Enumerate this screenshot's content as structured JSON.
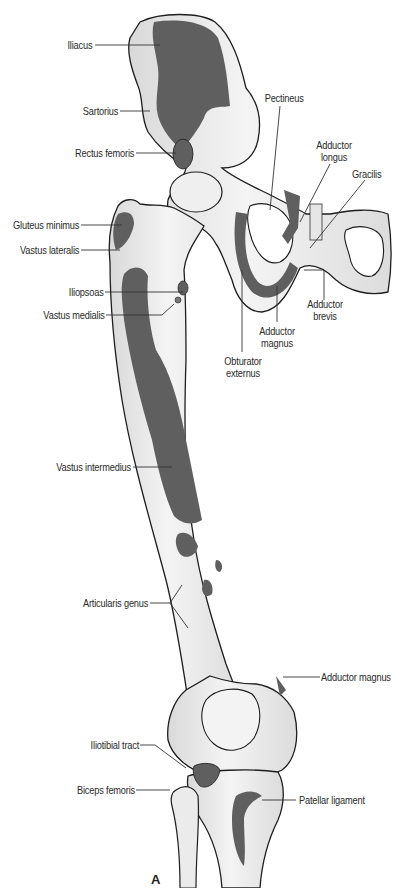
{
  "figure": {
    "panel_letter": "A",
    "colors": {
      "bone": "#ededed",
      "bone_shadow": "#d6d6d6",
      "muscle_attachment": "#5f5f5f",
      "outline": "#1e1e1e",
      "leader_line": "#333333",
      "text": "#2a2a2a"
    },
    "labels": {
      "iliacus": "Iliacus",
      "sartorius": "Sartorius",
      "rectus_femoris": "Rectus femoris",
      "pectineus": "Pectineus",
      "adductor_longus_1": "Adductor",
      "adductor_longus_2": "longus",
      "gracilis": "Gracilis",
      "gluteus_minimus": "Gluteus minimus",
      "vastus_lateralis": "Vastus lateralis",
      "iliopsoas": "Iliopsoas",
      "vastus_medialis": "Vastus medialis",
      "adductor_brevis_1": "Adductor",
      "adductor_brevis_2": "brevis",
      "adductor_magnus_upper_1": "Adductor",
      "adductor_magnus_upper_2": "magnus",
      "obturator_externus_1": "Obturator",
      "obturator_externus_2": "externus",
      "vastus_intermedius": "Vastus intermedius",
      "articularis_genus": "Articularis genus",
      "adductor_magnus_lower": "Adductor magnus",
      "iliotibial_tract": "Iliotibial tract",
      "biceps_femoris": "Biceps femoris",
      "patellar_ligament": "Patellar ligament"
    }
  }
}
